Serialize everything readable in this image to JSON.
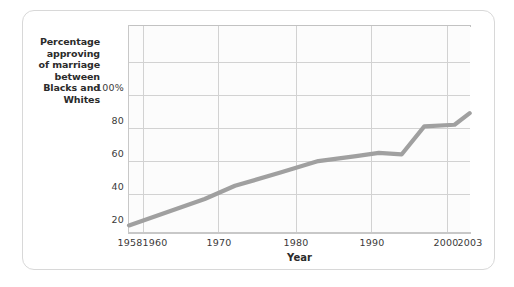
{
  "chart_data": {
    "type": "line",
    "title": "",
    "subtitle": "",
    "xlabel": "Year",
    "ylabel": "Percentage approving of marriage between Blacks and Whites",
    "ylabel_lines": [
      "Percentage",
      "approving",
      "of marriage",
      "between",
      "Blacks and",
      "Whites"
    ],
    "xlim": [
      1958,
      2003
    ],
    "ylim": [
      0,
      110
    ],
    "grid": true,
    "legend": "none",
    "xticks": [
      1958,
      1960,
      1970,
      1980,
      1990,
      2000,
      2003
    ],
    "xtick_labels": [
      "1958",
      "1960",
      "1970",
      "1980",
      "1990",
      "2000",
      "2003"
    ],
    "yticks": [
      20,
      40,
      60,
      80,
      100
    ],
    "ytick_labels": [
      "20",
      "40",
      "60",
      "80",
      "100%"
    ],
    "series": [
      {
        "name": "Percentage approving of marriage between Blacks and Whites",
        "color": "#a0a0a0",
        "x": [
          1958,
          1968,
          1972,
          1978,
          1983,
          1988,
          1991,
          1994,
          1997,
          2001,
          2003
        ],
        "values": [
          4,
          20,
          28,
          36,
          43,
          46,
          48,
          47,
          64,
          65,
          72
        ]
      }
    ]
  },
  "axis": {
    "xlabel": "Year",
    "ytick_100": "100%",
    "ytick_80": "80",
    "ytick_60": "60",
    "ytick_40": "40",
    "ytick_20": "20",
    "xtick_1958": "1958",
    "xtick_1960": "1960",
    "xtick_1970": "1970",
    "xtick_1980": "1980",
    "xtick_1990": "1990",
    "xtick_2000": "2000",
    "xtick_2003": "2003"
  },
  "ylabel_lines": {
    "l0": "Percentage",
    "l1": "approving",
    "l2": "of marriage",
    "l3": "between",
    "l4": "Blacks and",
    "l5": "Whites"
  },
  "colors": {
    "line": "#a0a0a0",
    "grid": "#d2d2d2",
    "axis": "#c8c8c8",
    "card_border": "#d8d8d8",
    "plot_bg": "#fcfcfc",
    "text": "#2b2b2b"
  }
}
